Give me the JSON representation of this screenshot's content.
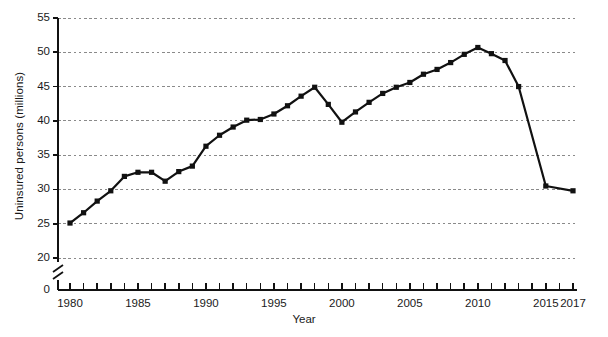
{
  "chart_data": {
    "type": "line",
    "title": "",
    "xlabel": "Year",
    "ylabel": "Uninsured persons (millions)",
    "xlim": [
      1979.3,
      2017.6
    ],
    "ylim": [
      18.6,
      55.8
    ],
    "grid": true,
    "legend": null,
    "axis_break_y": true,
    "y_ticks": [
      0,
      20,
      25,
      30,
      35,
      40,
      45,
      50,
      55
    ],
    "y_tick_labels": [
      "0",
      "20",
      "25",
      "30",
      "35",
      "40",
      "45",
      "50",
      "55"
    ],
    "x_ticks": [
      1980,
      1981,
      1982,
      1983,
      1984,
      1985,
      1986,
      1987,
      1988,
      1989,
      1990,
      1991,
      1992,
      1993,
      1994,
      1995,
      1996,
      1997,
      1998,
      1999,
      2000,
      2001,
      2002,
      2003,
      2004,
      2005,
      2006,
      2007,
      2008,
      2009,
      2010,
      2011,
      2012,
      2013,
      2014,
      2015,
      2016,
      2017
    ],
    "x_tick_labels": [
      "1980",
      "1985",
      "1990",
      "1995",
      "2000",
      "2005",
      "2010",
      "2015",
      "2017"
    ],
    "x_tick_label_years": [
      1980,
      1985,
      1990,
      1995,
      2000,
      2005,
      2010,
      2015,
      2017
    ],
    "marker": "filled-square",
    "line_color": "#111111",
    "grid_color": "#8a8a8a",
    "x": [
      1980,
      1981,
      1982,
      1983,
      1984,
      1985,
      1986,
      1987,
      1988,
      1989,
      1990,
      1991,
      1992,
      1993,
      1994,
      1995,
      1996,
      1997,
      1998,
      1999,
      2000,
      2001,
      2002,
      2003,
      2004,
      2005,
      2006,
      2007,
      2008,
      2009,
      2010,
      2011,
      2012,
      2013,
      2015,
      2017
    ],
    "values": [
      25.1,
      26.6,
      28.3,
      29.8,
      31.9,
      32.5,
      32.5,
      31.2,
      32.6,
      33.4,
      36.3,
      37.9,
      39.1,
      40.1,
      40.2,
      41.0,
      42.2,
      43.6,
      44.9,
      42.4,
      39.8,
      41.3,
      42.7,
      44.0,
      44.9,
      45.6,
      46.8,
      47.5,
      48.5,
      49.7,
      50.7,
      49.8,
      48.8,
      45.0,
      30.5,
      29.8
    ],
    "annotations": []
  },
  "axes": {
    "y_axis_label": "Uninsured persons (millions)",
    "x_axis_label": "Year"
  },
  "caption": {
    "source_text": ""
  }
}
